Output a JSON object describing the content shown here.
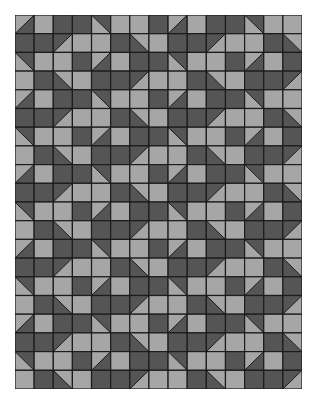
{
  "quilt": {
    "rows": 20,
    "cols": 15,
    "colors": {
      "light": "#a6a6a6",
      "dark": "#555555",
      "line": "#1c1c1c"
    },
    "legend": "L = light square, D = dark square, tl/tr/bl/br = half-square triangle with light half in that corner",
    "tile": [
      [
        "tl",
        "L",
        "D",
        "D",
        "bl",
        "L",
        "L",
        "D"
      ],
      [
        "D",
        "D",
        "br",
        "L",
        "L",
        "D",
        "tr",
        "L"
      ],
      [
        "bl",
        "L",
        "L",
        "D",
        "tl",
        "L",
        "D",
        "D"
      ],
      [
        "L",
        "D",
        "tr",
        "L",
        "D",
        "D",
        "br",
        "L"
      ]
    ]
  }
}
